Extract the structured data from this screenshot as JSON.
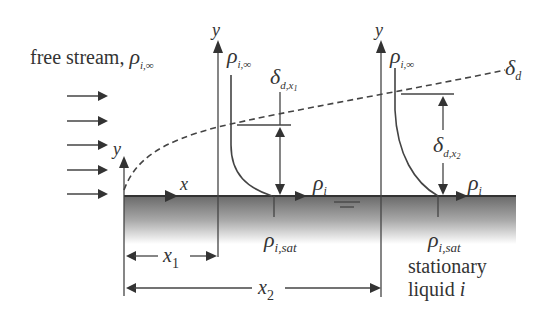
{
  "diagram": {
    "type": "boundary-layer-concentration-profile",
    "labels": {
      "free_stream_text": "free stream, ",
      "rho": "ρ",
      "sub_inf": "i,∞",
      "sub_i": "i",
      "sub_sat": "i,sat",
      "y": "y",
      "x": "x",
      "x1": "x",
      "x1_sub": "1",
      "x2": "x",
      "x2_sub": "2",
      "delta": "δ",
      "delta_d_sub": "d",
      "delta_x1_sub": "d,x",
      "delta_x1_subsub": "1",
      "delta_x2_sub": "d,x",
      "delta_x2_subsub": "2",
      "stationary_line1": "stationary",
      "stationary_line2_text": "liquid ",
      "stationary_line2_ital": "i"
    },
    "elements": [
      "free stream arrows (5)",
      "leading edge y-axis",
      "x-axis along plate",
      "concentration boundary layer edge δ_d (dashed)",
      "profile at x1 with thickness δ_d,x1",
      "profile at x2 with thickness δ_d,x2",
      "liquid surface (gradient)",
      "x1 and x2 dimension arrows"
    ],
    "colors": {
      "ink": "#333333",
      "liquid_top": "#6e6e6e",
      "liquid_bottom": "#ffffff"
    }
  }
}
